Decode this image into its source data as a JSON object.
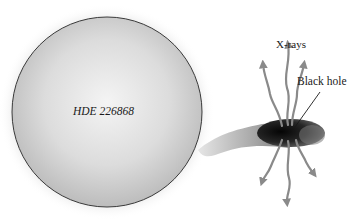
{
  "diagram": {
    "star": {
      "label": "HDE 226868"
    },
    "black_hole": {
      "label": "Black hole"
    },
    "emission": {
      "label": "X-rays"
    }
  },
  "colors": {
    "background": "#ffffff",
    "star_fill_light": "#f2f2f2",
    "star_fill_dark": "#b9b9b9",
    "star_outline": "#3a3a3a",
    "disk_dark": "#111111",
    "disk_edge": "#6e6e6e",
    "stream": "#9a9a9a",
    "arrow": "#8a8a8a",
    "text": "#1a1a1a"
  }
}
